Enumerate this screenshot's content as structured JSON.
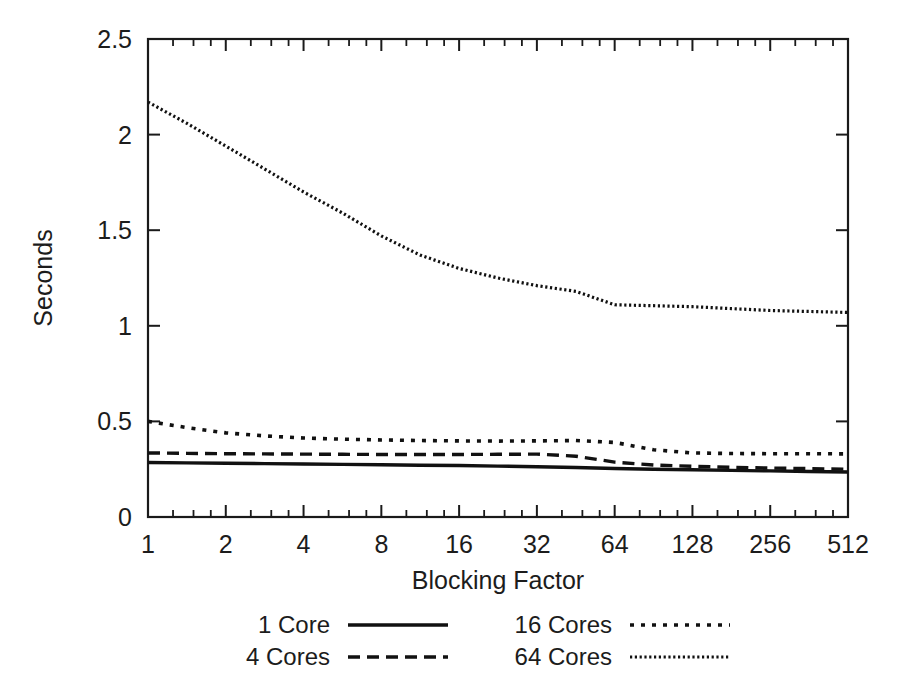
{
  "chart_data": {
    "type": "line",
    "title": "",
    "xlabel": "Blocking Factor",
    "ylabel": "Seconds",
    "x_scale": "log2",
    "xlim": [
      1,
      512
    ],
    "ylim": [
      0,
      2.5
    ],
    "grid": false,
    "legend_position": "below-plot",
    "x_tick_labels": [
      "1",
      "2",
      "4",
      "8",
      "16",
      "32",
      "64",
      "128",
      "256",
      "512"
    ],
    "x_tick_values": [
      1,
      2,
      4,
      8,
      16,
      32,
      64,
      128,
      256,
      512
    ],
    "y_tick_labels": [
      "0",
      "0.5",
      "1",
      "1.5",
      "2",
      "2.5"
    ],
    "y_tick_values": [
      0,
      0.5,
      1,
      1.5,
      2,
      2.5
    ],
    "x": [
      1,
      1.41,
      2,
      2.83,
      4,
      5.66,
      8,
      11.3,
      16,
      22.6,
      32,
      45.3,
      64,
      90.5,
      128,
      181,
      256,
      362,
      512
    ],
    "series": [
      {
        "name": "1 Core",
        "style": "solid",
        "values": [
          0.285,
          0.283,
          0.281,
          0.279,
          0.277,
          0.275,
          0.273,
          0.271,
          0.269,
          0.266,
          0.263,
          0.259,
          0.254,
          0.25,
          0.247,
          0.244,
          0.241,
          0.238,
          0.235
        ]
      },
      {
        "name": "4 Cores",
        "style": "dashed",
        "values": [
          0.335,
          0.333,
          0.331,
          0.33,
          0.329,
          0.328,
          0.327,
          0.327,
          0.327,
          0.328,
          0.329,
          0.318,
          0.287,
          0.272,
          0.265,
          0.26,
          0.256,
          0.253,
          0.25
        ]
      },
      {
        "name": "16 Cores",
        "style": "dotted",
        "values": [
          0.5,
          0.468,
          0.44,
          0.424,
          0.413,
          0.407,
          0.403,
          0.4,
          0.398,
          0.397,
          0.398,
          0.4,
          0.39,
          0.352,
          0.335,
          0.332,
          0.331,
          0.331,
          0.33
        ]
      },
      {
        "name": "64 Cores",
        "style": "fine-dotted",
        "values": [
          2.17,
          2.06,
          1.94,
          1.82,
          1.7,
          1.59,
          1.47,
          1.37,
          1.3,
          1.25,
          1.21,
          1.18,
          1.11,
          1.105,
          1.1,
          1.09,
          1.08,
          1.075,
          1.07
        ]
      }
    ],
    "legend_entries": [
      {
        "label": "1 Core",
        "style": "solid"
      },
      {
        "label": "16 Cores",
        "style": "dotted"
      },
      {
        "label": "4 Cores",
        "style": "dashed"
      },
      {
        "label": "64 Cores",
        "style": "fine-dotted"
      }
    ]
  }
}
